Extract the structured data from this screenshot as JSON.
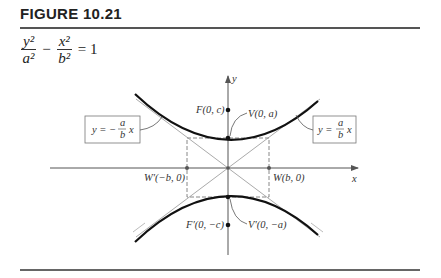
{
  "figure": {
    "title": "FIGURE 10.21",
    "equation": {
      "term1_num": "y²",
      "term1_den": "a²",
      "minus": "−",
      "term2_num": "x²",
      "term2_den": "b²",
      "equals": "= 1"
    }
  },
  "diagram": {
    "axes": {
      "x_label": "x",
      "y_label": "y"
    },
    "points": {
      "focus_top": "F(0, c)",
      "vertex_top": "V(0, a)",
      "vertex_bottom": "V′(0, −a)",
      "focus_bottom": "F′(0, −c)",
      "co_vertex_left": "W′(−b, 0)",
      "co_vertex_right": "W(b, 0)"
    },
    "asymptotes": {
      "negative": {
        "lhs": "y = −",
        "num": "a",
        "den": "b",
        "var": "x"
      },
      "positive": {
        "lhs": "y =",
        "num": "a",
        "den": "b",
        "var": "x"
      }
    }
  }
}
